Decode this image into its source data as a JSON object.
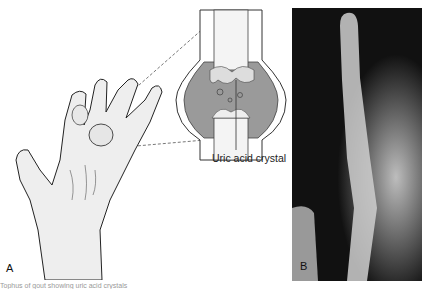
{
  "figure": {
    "panels": [
      {
        "id": "A",
        "label": "A",
        "description": "Illustration of hand with gouty swelling and joint cross-section inset"
      },
      {
        "id": "B",
        "label": "B",
        "description": "X-ray of finger showing gouty joint"
      }
    ],
    "callout_label": "Uric acid crystal",
    "caption_fragment": "Tophus of gout showing uric acid crystals"
  }
}
